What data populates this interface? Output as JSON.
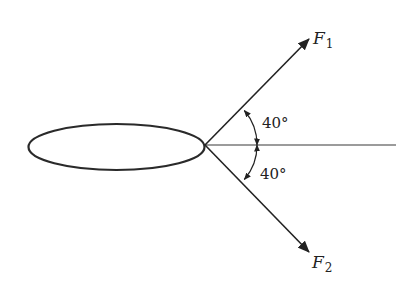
{
  "diagram": {
    "type": "force-vector-diagram",
    "body": {
      "shape": "ellipse",
      "label": ""
    },
    "reference_line": {
      "orientation": "horizontal"
    },
    "forces": [
      {
        "id": "F1",
        "label": "F",
        "subscript": "1",
        "direction": "up-right",
        "angle_from_horizontal_deg": 40,
        "angle_label": "40°"
      },
      {
        "id": "F2",
        "label": "F",
        "subscript": "2",
        "direction": "down-right",
        "angle_from_horizontal_deg": -40,
        "angle_label": "40°"
      }
    ],
    "colors": {
      "stroke": "#222222",
      "reference_line": "#777777",
      "background": "#ffffff"
    }
  }
}
